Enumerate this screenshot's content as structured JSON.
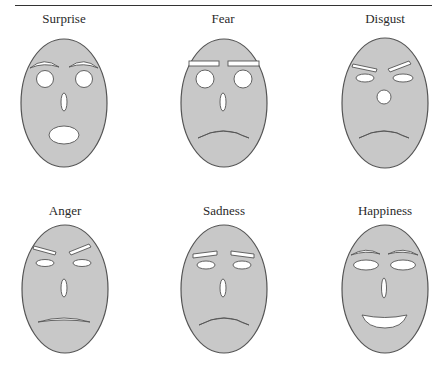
{
  "figure": {
    "style": {
      "face_fill": "#c8c8c8",
      "face_stroke": "#555555",
      "feature_fill": "#ffffff",
      "feature_stroke": "#555555"
    },
    "faces": [
      {
        "label": "Surprise",
        "label_x": 64,
        "label_y": 12
      },
      {
        "label": "Fear",
        "label_x": 223,
        "label_y": 12
      },
      {
        "label": "Disgust",
        "label_x": 385,
        "label_y": 12
      },
      {
        "label": "Anger",
        "label_x": 65,
        "label_y": 204
      },
      {
        "label": "Sadness",
        "label_x": 224,
        "label_y": 204
      },
      {
        "label": "Happiness",
        "label_x": 385,
        "label_y": 204
      }
    ]
  }
}
